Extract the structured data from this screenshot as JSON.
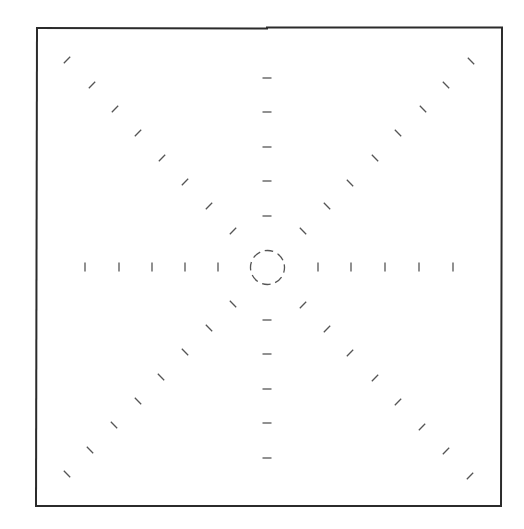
{
  "canvas": {
    "width": 524,
    "height": 529,
    "background": "#ffffff"
  },
  "frame": {
    "stroke": "#2b2b2b",
    "stroke_width": 2,
    "top_left": [
      37,
      28
    ],
    "top_right": [
      502,
      28
    ],
    "bottom_right": [
      501,
      506
    ],
    "bottom_left": [
      36,
      506
    ],
    "top_step_x": 267
  },
  "center_circle": {
    "cx": 267.5,
    "cy": 267.5,
    "r": 17,
    "stroke": "#555555",
    "stroke_width": 1.3,
    "dasharray": "8.5 4.85"
  },
  "marks": {
    "stroke": "#555555",
    "stroke_width": 1.3,
    "length": 9,
    "rays": [
      {
        "name": "ray-left",
        "orientation": "vertical",
        "points": [
          [
            85,
            267
          ],
          [
            119,
            267
          ],
          [
            152,
            267
          ],
          [
            185,
            267
          ],
          [
            218,
            267
          ]
        ]
      },
      {
        "name": "ray-right",
        "orientation": "vertical",
        "points": [
          [
            318,
            267
          ],
          [
            351,
            267
          ],
          [
            385,
            267
          ],
          [
            419,
            267
          ],
          [
            453,
            267
          ]
        ]
      },
      {
        "name": "ray-up",
        "orientation": "horizontal",
        "points": [
          [
            267,
            78
          ],
          [
            267,
            112
          ],
          [
            267,
            147
          ],
          [
            267,
            181
          ],
          [
            267,
            216
          ]
        ]
      },
      {
        "name": "ray-down",
        "orientation": "horizontal",
        "points": [
          [
            267,
            320
          ],
          [
            267,
            354
          ],
          [
            267,
            389
          ],
          [
            267,
            423
          ],
          [
            267,
            458
          ]
        ]
      },
      {
        "name": "ray-up-left",
        "orientation": "slash",
        "points": [
          [
            67,
            60
          ],
          [
            92,
            85
          ],
          [
            115,
            109
          ],
          [
            138,
            133
          ],
          [
            162,
            158
          ],
          [
            185,
            182
          ],
          [
            209,
            206
          ],
          [
            233,
            231
          ]
        ]
      },
      {
        "name": "ray-up-right",
        "orientation": "backslash",
        "points": [
          [
            471,
            61
          ],
          [
            446,
            85
          ],
          [
            423,
            109
          ],
          [
            398,
            133
          ],
          [
            375,
            158
          ],
          [
            350,
            183
          ],
          [
            327,
            206
          ],
          [
            303,
            231
          ]
        ]
      },
      {
        "name": "ray-down-left",
        "orientation": "backslash",
        "points": [
          [
            233,
            304
          ],
          [
            209,
            328
          ],
          [
            185,
            352
          ],
          [
            161,
            377
          ],
          [
            138,
            401
          ],
          [
            114,
            425
          ],
          [
            90,
            450
          ],
          [
            67,
            474
          ]
        ]
      },
      {
        "name": "ray-down-right",
        "orientation": "slash",
        "points": [
          [
            303,
            305
          ],
          [
            327,
            329
          ],
          [
            350,
            353
          ],
          [
            375,
            378
          ],
          [
            398,
            402
          ],
          [
            422,
            427
          ],
          [
            446,
            451
          ],
          [
            470,
            476
          ]
        ]
      }
    ]
  }
}
